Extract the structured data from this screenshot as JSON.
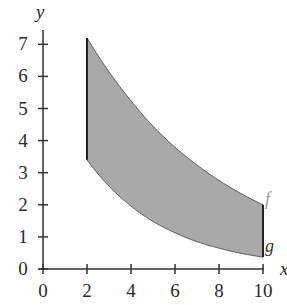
{
  "chart_data": {
    "type": "area",
    "title": "",
    "xlabel": "x",
    "ylabel": "y",
    "xlim": [
      0,
      10
    ],
    "ylim": [
      0,
      7
    ],
    "x_ticks": [
      0,
      2,
      4,
      6,
      8,
      10
    ],
    "y_ticks": [
      0,
      1,
      2,
      3,
      4,
      5,
      6,
      7
    ],
    "x_tick_labels": [
      "0",
      "2",
      "4",
      "6",
      "8",
      "10"
    ],
    "y_tick_labels": [
      "0",
      "1",
      "2",
      "3",
      "4",
      "5",
      "6",
      "7"
    ],
    "grid": false,
    "legend": null,
    "shaded_region": {
      "x_from": 2,
      "x_to": 10,
      "between": [
        "f",
        "g"
      ],
      "color": "#a9a9a9"
    },
    "series": [
      {
        "name": "f",
        "label": "f",
        "label_color": "#9a9a9a",
        "x": [
          2,
          3,
          4,
          5,
          6,
          7,
          8,
          9,
          10
        ],
        "values": [
          7.2,
          6.14,
          5.24,
          4.45,
          3.79,
          3.24,
          2.76,
          2.35,
          2.0
        ]
      },
      {
        "name": "g",
        "label": "g",
        "label_color": "#333333",
        "x": [
          2,
          3,
          4,
          5,
          6,
          7,
          8,
          9,
          10
        ],
        "values": [
          3.4,
          2.58,
          1.96,
          1.48,
          1.13,
          0.85,
          0.65,
          0.49,
          0.37
        ]
      }
    ]
  }
}
